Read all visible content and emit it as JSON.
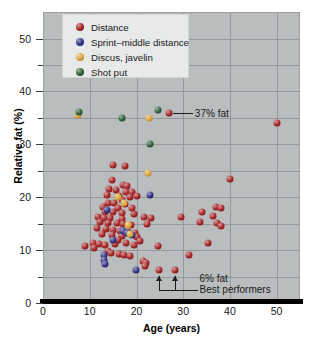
{
  "chart_data": {
    "type": "scatter",
    "title": "",
    "xlabel": "Age (years)",
    "ylabel": "Relative fat (%)",
    "xlim": [
      0,
      55
    ],
    "ylim": [
      0,
      55
    ],
    "xticks": [
      0,
      10,
      20,
      30,
      40,
      50
    ],
    "yticks": [
      0,
      10,
      20,
      30,
      40,
      50
    ],
    "yticks_minor": [
      5,
      15,
      25,
      35,
      45
    ],
    "grid": "both",
    "legend_position": "top-left",
    "background_color": "#b9bdbe",
    "legend": [
      {
        "label": "Distance",
        "color": "#a32224"
      },
      {
        "label": "Sprint–middle distance",
        "color": "#2e2f80"
      },
      {
        "label": "Discus, javelin",
        "color": "#d9a43a"
      },
      {
        "label": "Shot put",
        "color": "#2b5d36"
      }
    ],
    "annotations": [
      {
        "text": "37% fat",
        "x": 32.5,
        "y": 35.8
      },
      {
        "text": "6% fat",
        "x": 33.5,
        "y": 4.6
      },
      {
        "text": "Best performers",
        "x": 33.5,
        "y": 2.4
      }
    ],
    "series": [
      {
        "name": "Distance",
        "color": "#a32224",
        "points": [
          [
            27.0,
            35.9
          ],
          [
            50.0,
            34.1
          ],
          [
            15.0,
            26.0
          ],
          [
            17.5,
            25.9
          ],
          [
            14.8,
            23.2
          ],
          [
            17.2,
            22.4
          ],
          [
            18.0,
            22.1
          ],
          [
            40.0,
            23.4
          ],
          [
            14.2,
            21.5
          ],
          [
            15.6,
            21.3
          ],
          [
            17.8,
            21.0
          ],
          [
            19.0,
            20.9
          ],
          [
            13.6,
            20.4
          ],
          [
            16.3,
            20.2
          ],
          [
            18.6,
            20.1
          ],
          [
            20.2,
            20.3
          ],
          [
            16.9,
            19.4
          ],
          [
            14.0,
            19.0
          ],
          [
            15.2,
            18.9
          ],
          [
            17.5,
            18.7
          ],
          [
            12.9,
            18.2
          ],
          [
            16.0,
            18.0
          ],
          [
            37.0,
            18.2
          ],
          [
            38.1,
            18.0
          ],
          [
            13.2,
            17.3
          ],
          [
            15.0,
            17.2
          ],
          [
            16.8,
            17.0
          ],
          [
            19.5,
            16.9
          ],
          [
            11.8,
            16.3
          ],
          [
            13.0,
            16.1
          ],
          [
            14.4,
            16.0
          ],
          [
            17.0,
            15.9
          ],
          [
            21.5,
            16.2
          ],
          [
            23.0,
            16.0
          ],
          [
            29.5,
            16.2
          ],
          [
            34.0,
            17.3
          ],
          [
            36.4,
            16.4
          ],
          [
            12.2,
            15.4
          ],
          [
            14.0,
            15.2
          ],
          [
            15.8,
            15.1
          ],
          [
            17.2,
            14.9
          ],
          [
            18.8,
            14.8
          ],
          [
            22.3,
            15.0
          ],
          [
            33.6,
            15.4
          ],
          [
            37.2,
            15.2
          ],
          [
            38.0,
            14.6
          ],
          [
            11.5,
            14.2
          ],
          [
            13.4,
            14.0
          ],
          [
            15.0,
            13.9
          ],
          [
            16.5,
            13.6
          ],
          [
            18.2,
            13.4
          ],
          [
            19.6,
            13.2
          ],
          [
            12.6,
            13.0
          ],
          [
            14.8,
            12.8
          ],
          [
            17.0,
            12.6
          ],
          [
            20.0,
            12.4
          ],
          [
            10.7,
            11.4
          ],
          [
            12.0,
            11.2
          ],
          [
            13.2,
            11.0
          ],
          [
            15.4,
            11.2
          ],
          [
            17.8,
            11.3
          ],
          [
            19.4,
            11.0
          ],
          [
            24.5,
            10.7
          ],
          [
            35.3,
            11.3
          ],
          [
            9.0,
            10.7
          ],
          [
            11.0,
            10.4
          ],
          [
            13.8,
            9.8
          ],
          [
            14.6,
            9.5
          ],
          [
            16.2,
            9.2
          ],
          [
            17.4,
            9.0
          ],
          [
            18.6,
            8.8
          ],
          [
            31.2,
            9.0
          ],
          [
            21.4,
            8.0
          ],
          [
            22.0,
            7.6
          ],
          [
            21.8,
            7.0
          ],
          [
            24.8,
            6.2
          ],
          [
            28.2,
            6.3
          ],
          [
            16.0,
            12.0
          ],
          [
            19.0,
            18.0
          ],
          [
            20.8,
            11.8
          ]
        ]
      },
      {
        "name": "Sprint–middle distance",
        "color": "#2e2f80",
        "points": [
          [
            22.8,
            20.5
          ],
          [
            13.6,
            17.5
          ],
          [
            17.2,
            13.6
          ],
          [
            18.0,
            13.3
          ],
          [
            19.1,
            12.9
          ],
          [
            13.0,
            9.0
          ],
          [
            13.1,
            8.1
          ],
          [
            13.2,
            7.3
          ],
          [
            19.8,
            6.3
          ],
          [
            15.0,
            12.0
          ]
        ]
      },
      {
        "name": "Discus, javelin",
        "color": "#d9a43a",
        "points": [
          [
            22.6,
            34.9
          ],
          [
            22.4,
            24.5
          ],
          [
            16.1,
            20.1
          ],
          [
            17.4,
            18.9
          ],
          [
            18.2,
            14.8
          ],
          [
            18.6,
            13.0
          ],
          [
            7.4,
            35.5
          ]
        ]
      },
      {
        "name": "Shot put",
        "color": "#2b5d36",
        "points": [
          [
            7.6,
            36.1
          ],
          [
            17.0,
            34.9
          ],
          [
            24.6,
            36.5
          ],
          [
            22.8,
            30.0
          ]
        ]
      }
    ]
  }
}
